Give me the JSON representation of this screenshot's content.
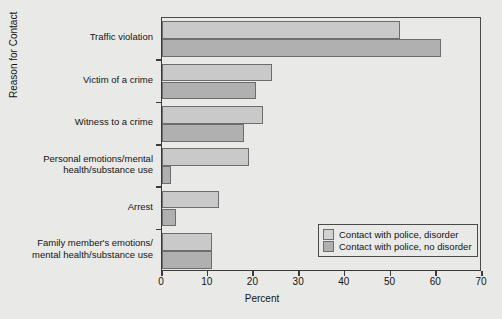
{
  "chart_data": {
    "type": "bar",
    "orientation": "horizontal",
    "title": "",
    "xlabel": "Percent",
    "ylabel": "Reason for Contact",
    "xlim": [
      0,
      70
    ],
    "xticks": [
      0,
      10,
      20,
      30,
      40,
      50,
      60,
      70
    ],
    "xtick_labels": [
      "0",
      "10",
      "20",
      "30",
      "40",
      "50",
      "60",
      "70"
    ],
    "grid": false,
    "legend_position": "bottom-right",
    "categories": [
      "Traffic violation",
      "Victim of a crime",
      "Witness to a crime",
      "Personal emotions/mental\nhealth/substance use",
      "Arrest",
      "Family member's emotions/\nmental health/substance use"
    ],
    "series": [
      {
        "name": "Contact with police, disorder",
        "color": "#c9c9c9",
        "values": [
          52,
          24,
          22,
          19,
          12.5,
          11
        ]
      },
      {
        "name": "Contact with police, no disorder",
        "color": "#b0b0b0",
        "values": [
          61,
          20.5,
          18,
          2,
          3,
          11
        ]
      }
    ]
  },
  "legend": {
    "items": [
      {
        "label": "Contact with police, disorder",
        "swatch": "disorder"
      },
      {
        "label": "Contact with police, no disorder",
        "swatch": "nodisorder"
      }
    ]
  },
  "axes": {
    "x_title": "Percent",
    "y_title": "Reason for Contact"
  }
}
